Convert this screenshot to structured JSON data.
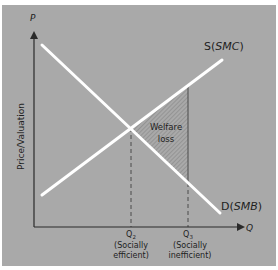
{
  "diagram": {
    "type": "supply-demand-externality",
    "colors": {
      "background": "#a9a9a9",
      "curves": "#ffffff",
      "axes": "#3a3a3a",
      "hatch": "#7a7a7a",
      "text": "#1e1e1e"
    },
    "axes": {
      "y_symbol": "P",
      "y_label": "Price/Valuation",
      "x_symbol": "Q"
    },
    "curves": {
      "supply": {
        "prefix": "S(",
        "name": "SMC",
        "suffix": ")"
      },
      "demand": {
        "prefix": "D(",
        "name": "SMB",
        "suffix": ")"
      }
    },
    "region": {
      "line1": "Welfare",
      "line2": "loss"
    },
    "quantities": [
      {
        "symbol": "Q",
        "subscript": "2",
        "line1": "(Socially",
        "line2": "efficient)"
      },
      {
        "symbol": "Q",
        "subscript": "3",
        "line1": "(Socially",
        "line2": "inefficient)"
      }
    ]
  }
}
